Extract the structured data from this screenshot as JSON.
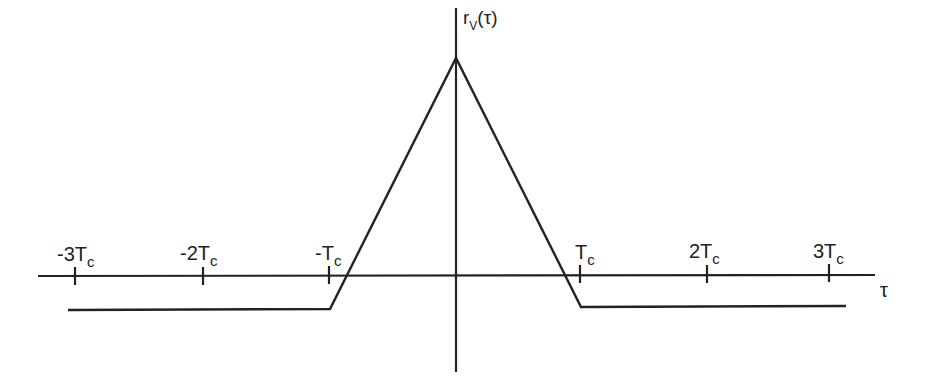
{
  "diagram": {
    "y_axis_label": "r",
    "y_axis_subscript": "V",
    "y_axis_arg": "(τ)",
    "x_axis_label": "τ",
    "ticks": [
      {
        "label": "-3T",
        "sub": "c",
        "x": 75
      },
      {
        "label": "-2T",
        "sub": "c",
        "x": 203
      },
      {
        "label": "-T",
        "sub": "c",
        "x": 329
      },
      {
        "label": "T",
        "sub": "c",
        "x": 580
      },
      {
        "label": "2T",
        "sub": "c",
        "x": 707
      },
      {
        "label": "3T",
        "sub": "c",
        "x": 829
      }
    ],
    "curve_description": "Triangular autocorrelation peak at τ=0, crossing zero near ±Tc, constant negative offset for |τ| ≥ Tc",
    "colors": {
      "line": "#222222",
      "background": "#ffffff"
    }
  }
}
